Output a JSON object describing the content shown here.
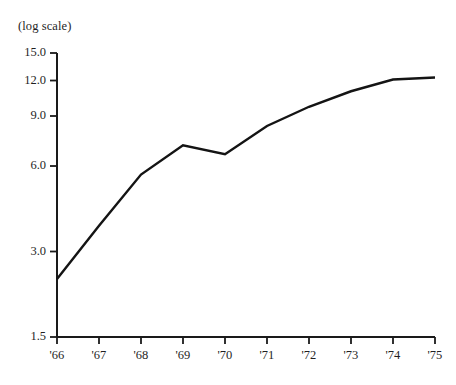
{
  "chart_data": {
    "type": "line",
    "title": "",
    "subtitle": "",
    "scale_note": "(log scale)",
    "xlabel": "",
    "ylabel": "",
    "yscale": "log",
    "grid": false,
    "legend": false,
    "legend_position": "none",
    "line_color": "#141414",
    "axis_color": "#1a1a1a",
    "categories": [
      "'66",
      "'67",
      "'68",
      "'69",
      "'70",
      "'71",
      "'72",
      "'73",
      "'74",
      "'75"
    ],
    "x": [
      1966,
      1967,
      1968,
      1969,
      1970,
      1971,
      1972,
      1973,
      1974,
      1975
    ],
    "values": [
      2.4,
      3.7,
      5.6,
      7.1,
      6.6,
      8.3,
      9.7,
      11.0,
      12.1,
      12.3
    ],
    "ylim": [
      1.5,
      15.0
    ],
    "ytick_labels": [
      "15.0",
      "12.0",
      "9.0",
      "6.0",
      "3.0",
      "1.5"
    ],
    "ytick_values": [
      15.0,
      12.0,
      9.0,
      6.0,
      3.0,
      1.5
    ],
    "xtick_labels": [
      "'66",
      "'67",
      "'68",
      "'69",
      "'70",
      "'71",
      "'72",
      "'73",
      "'74",
      "'75"
    ]
  }
}
